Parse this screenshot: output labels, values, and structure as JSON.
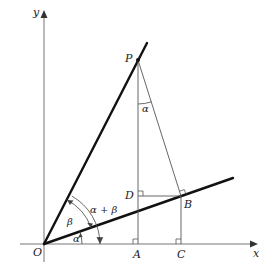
{
  "figure": {
    "axes": {
      "x_label": "x",
      "y_label": "y",
      "origin_label": "O"
    },
    "points": [
      {
        "name": "O",
        "label": "O"
      },
      {
        "name": "P",
        "label": "P"
      },
      {
        "name": "A",
        "label": "A"
      },
      {
        "name": "B",
        "label": "B"
      },
      {
        "name": "C",
        "label": "C"
      },
      {
        "name": "D",
        "label": "D"
      }
    ],
    "angles": {
      "alpha_at_O": "α",
      "beta_at_O": "β",
      "alpha_plus_beta": "α + β",
      "alpha_at_P": "α"
    },
    "colors": {
      "thick_lines": "#111111",
      "thin_lines": "#555555",
      "axes": "#777777"
    }
  }
}
